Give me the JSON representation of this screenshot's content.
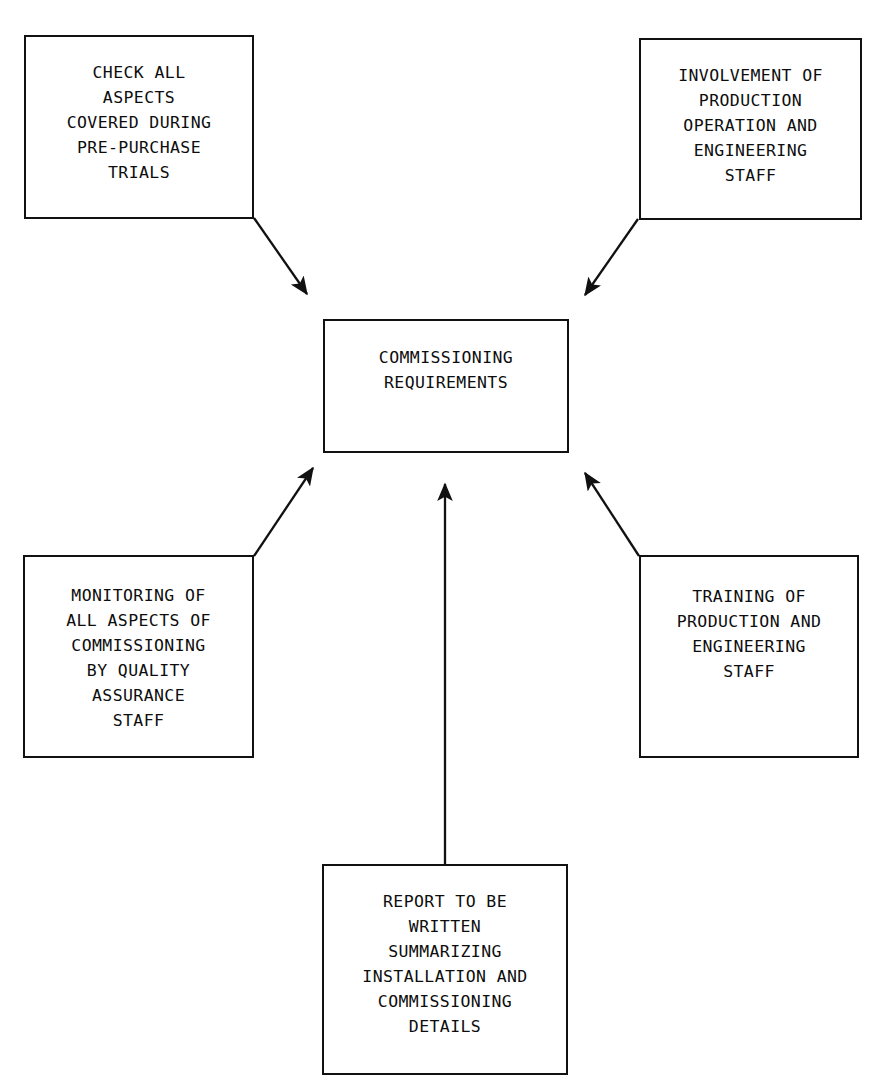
{
  "diagram": {
    "title": "Commissioning Requirements",
    "style": {
      "background": "#ffffff",
      "line_color": "#111111",
      "text_color": "#0d0d0d"
    },
    "center": {
      "id": "commissioning-requirements",
      "text": "COMMISSIONING\nREQUIREMENTS"
    },
    "nodes": [
      {
        "id": "check-all-aspects",
        "position": "top-left",
        "text": "CHECK ALL\nASPECTS\nCOVERED DURING\nPRE-PURCHASE\nTRIALS"
      },
      {
        "id": "involvement-of-production",
        "position": "top-right",
        "text": "INVOLVEMENT OF\nPRODUCTION\nOPERATION AND\nENGINEERING\nSTAFF"
      },
      {
        "id": "monitoring-quality-assurance",
        "position": "bottom-left",
        "text": "MONITORING OF\nALL ASPECTS OF\nCOMMISSIONING\nBY QUALITY\nASSURANCE\nSTAFF"
      },
      {
        "id": "training-of-production",
        "position": "bottom-right",
        "text": "TRAINING OF\nPRODUCTION AND\nENGINEERING\nSTAFF"
      },
      {
        "id": "report-to-be-written",
        "position": "bottom-center",
        "text": "REPORT TO BE\nWRITTEN\nSUMMARIZING\nINSTALLATION AND\nCOMMISSIONING\nDETAILS"
      }
    ],
    "edges": [
      {
        "id": "edge-check-all-aspects-to-center",
        "from": "check-all-aspects",
        "to": "commissioning-requirements",
        "arrowhead": "to-center"
      },
      {
        "id": "edge-involvement-of-production-to-center",
        "from": "involvement-of-production",
        "to": "commissioning-requirements",
        "arrowhead": "to-center"
      },
      {
        "id": "edge-monitoring-quality-assurance-to-center",
        "from": "monitoring-quality-assurance",
        "to": "commissioning-requirements",
        "arrowhead": "to-center"
      },
      {
        "id": "edge-training-of-production-to-center",
        "from": "training-of-production",
        "to": "commissioning-requirements",
        "arrowhead": "to-center"
      },
      {
        "id": "edge-report-to-be-written-to-center",
        "from": "report-to-be-written",
        "to": "commissioning-requirements",
        "arrowhead": "to-center"
      }
    ]
  }
}
